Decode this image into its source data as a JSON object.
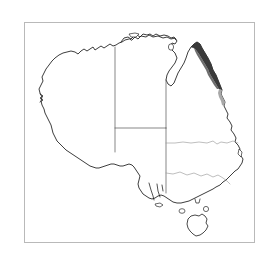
{
  "figure": {
    "kind": "map",
    "region_name": "Australia",
    "background_color": "#ffffff",
    "frame": {
      "visible": true,
      "border_color": "#b9b9b9",
      "x": 24,
      "y": 22,
      "width": 231,
      "height": 221
    }
  },
  "map": {
    "title": "",
    "projection_note": "",
    "coastline_color": "#1a1a1a",
    "landmass_fill": "#ffffff",
    "internal_border_color": "#555555",
    "river_border_color": "#9a9a9a",
    "highlight_color": "#3a3a3a",
    "highlight_label": "",
    "features": [
      {
        "id": "mainland",
        "name": "Australian mainland",
        "type": "landmass"
      },
      {
        "id": "tasmania",
        "name": "Tasmania",
        "type": "island"
      },
      {
        "id": "kangaroo-island",
        "name": "Kangaroo Island",
        "type": "island"
      },
      {
        "id": "melville-island",
        "name": "Melville Island",
        "type": "island"
      },
      {
        "id": "groote-eylandt",
        "name": "Groote Eylandt",
        "type": "island"
      },
      {
        "id": "fraser-island",
        "name": "Fraser Island",
        "type": "island"
      },
      {
        "id": "king-island",
        "name": "King Island",
        "type": "island"
      },
      {
        "id": "flinders-island",
        "name": "Flinders Island",
        "type": "island"
      }
    ],
    "internal_boundaries": [
      {
        "id": "wa-nt-sa",
        "name": "Western Australia eastern border",
        "style": "dark"
      },
      {
        "id": "nt-qld",
        "name": "Northern Territory / Queensland border",
        "style": "dark"
      },
      {
        "id": "nt-sa",
        "name": "Northern Territory / South Australia border",
        "style": "dark"
      },
      {
        "id": "sa-nsw-qld",
        "name": "South Australia eastern border",
        "style": "dark"
      },
      {
        "id": "qld-nsw",
        "name": "Queensland / New South Wales border",
        "style": "light"
      },
      {
        "id": "nsw-vic",
        "name": "New South Wales / Victoria border",
        "style": "light"
      }
    ],
    "highlight_regions": [
      {
        "id": "qld-coastal-strip",
        "name": "North-east Queensland coastal strip",
        "fill": "#3a3a3a",
        "description": "Shaded band along Cape York Peninsula east coast tapering south"
      }
    ]
  }
}
